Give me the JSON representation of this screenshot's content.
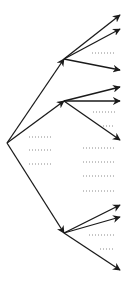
{
  "diagram": {
    "type": "tree",
    "title": "",
    "colors": {
      "line": "#1a1a1a",
      "dots": "#8a8a8a",
      "background": "#ffffff"
    },
    "root": {
      "id": "root",
      "x": 7,
      "y": 143
    },
    "branches": [
      {
        "id": "A",
        "x": 64,
        "y": 59,
        "leaves": [
          {
            "x": 120,
            "y": 15
          },
          {
            "x": 120,
            "y": 29
          },
          {
            "x": 120,
            "y": 70
          }
        ]
      },
      {
        "id": "B",
        "x": 64,
        "y": 101,
        "leaves": [
          {
            "x": 120,
            "y": 87
          },
          {
            "x": 120,
            "y": 101
          },
          {
            "x": 120,
            "y": 140
          }
        ]
      },
      {
        "id": "C",
        "x": 64,
        "y": 233,
        "leaves": [
          {
            "x": 120,
            "y": 205
          },
          {
            "x": 120,
            "y": 217
          },
          {
            "x": 120,
            "y": 270
          }
        ]
      }
    ],
    "dotted_placeholders": [
      {
        "x1": 92,
        "x2": 115,
        "y": 53
      },
      {
        "x1": 93,
        "x2": 115,
        "y": 112
      },
      {
        "x1": 103,
        "x2": 115,
        "y": 126
      },
      {
        "x1": 29,
        "x2": 51,
        "y": 137
      },
      {
        "x1": 29,
        "x2": 51,
        "y": 150
      },
      {
        "x1": 29,
        "x2": 51,
        "y": 164
      },
      {
        "x1": 83,
        "x2": 115,
        "y": 148
      },
      {
        "x1": 83,
        "x2": 115,
        "y": 162
      },
      {
        "x1": 83,
        "x2": 115,
        "y": 176
      },
      {
        "x1": 83,
        "x2": 115,
        "y": 191
      },
      {
        "x1": 89,
        "x2": 115,
        "y": 235
      },
      {
        "x1": 100,
        "x2": 115,
        "y": 249
      }
    ]
  }
}
